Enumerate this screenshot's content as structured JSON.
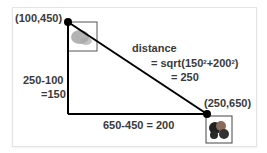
{
  "diagram": {
    "point_a": {
      "label": "(100,450)",
      "x": 100,
      "y": 450
    },
    "point_b": {
      "label": "(250,650)",
      "x": 250,
      "y": 650
    },
    "distance": {
      "title": "distance",
      "formula_prefix": "= sqrt(150",
      "sup1": "2",
      "formula_mid": "+200",
      "sup2": "2",
      "formula_suffix": ")",
      "result": "= 250"
    },
    "vertical_leg": {
      "line1": "250-100",
      "line2": "=150"
    },
    "horizontal_leg": {
      "label": "650-450 = 200"
    },
    "colors": {
      "line": "#000000",
      "text": "#3a3a3a",
      "box": "#555555"
    }
  }
}
